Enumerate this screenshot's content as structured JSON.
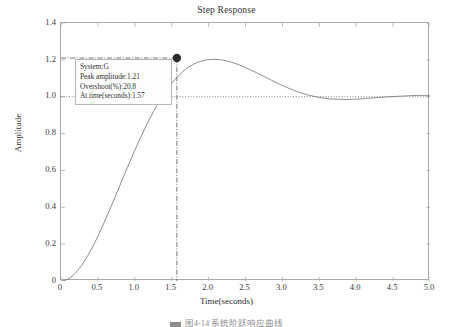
{
  "chart_data": {
    "type": "line",
    "title": "Step Response",
    "xlabel": "Time(seconds)",
    "ylabel": "Amplitude",
    "xlim": [
      0,
      5.0
    ],
    "ylim": [
      0,
      1.4
    ],
    "grid": false,
    "legend": "none",
    "xticks": [
      "0",
      "0.5",
      "1.0",
      "1.5",
      "2.0",
      "2.5",
      "3.0",
      "3.5",
      "4.0",
      "4.5",
      "5.0"
    ],
    "xtick_values": [
      0,
      0.5,
      1.0,
      1.5,
      2.0,
      2.5,
      3.0,
      3.5,
      4.0,
      4.5,
      5.0
    ],
    "yticks": [
      "0",
      "0.2",
      "0.4",
      "0.6",
      "0.8",
      "1.0",
      "1.2",
      "1.4"
    ],
    "ytick_values": [
      0,
      0.2,
      0.4,
      0.6,
      0.8,
      1.0,
      1.2,
      1.4
    ],
    "series": [
      {
        "name": "G",
        "color": "#808080",
        "x": [
          0,
          0.05,
          0.1,
          0.15,
          0.2,
          0.25,
          0.3,
          0.35,
          0.4,
          0.45,
          0.5,
          0.55,
          0.6,
          0.65,
          0.7,
          0.75,
          0.8,
          0.85,
          0.9,
          0.95,
          1.0,
          1.05,
          1.1,
          1.15,
          1.2,
          1.25,
          1.3,
          1.35,
          1.4,
          1.45,
          1.5,
          1.57,
          1.65,
          1.75,
          1.85,
          1.95,
          2.05,
          2.15,
          2.25,
          2.35,
          2.45,
          2.55,
          2.65,
          2.75,
          2.85,
          2.95,
          3.05,
          3.15,
          3.25,
          3.35,
          3.45,
          3.55,
          3.65,
          3.75,
          3.85,
          3.95,
          4.05,
          4.15,
          4.25,
          4.35,
          4.45,
          4.55,
          4.65,
          4.75,
          4.85,
          4.95,
          5.0
        ],
        "y": [
          0,
          0.003,
          0.012,
          0.026,
          0.045,
          0.069,
          0.097,
          0.129,
          0.164,
          0.202,
          0.243,
          0.286,
          0.331,
          0.377,
          0.424,
          0.472,
          0.52,
          0.568,
          0.616,
          0.663,
          0.709,
          0.754,
          0.797,
          0.839,
          0.879,
          0.917,
          0.953,
          0.987,
          1.018,
          1.047,
          1.073,
          1.105,
          1.137,
          1.166,
          1.186,
          1.198,
          1.203,
          1.201,
          1.194,
          1.182,
          1.167,
          1.149,
          1.13,
          1.11,
          1.09,
          1.07,
          1.052,
          1.035,
          1.021,
          1.009,
          1.0,
          0.993,
          0.988,
          0.986,
          0.985,
          0.986,
          0.988,
          0.991,
          0.994,
          0.997,
          1.0,
          1.002,
          1.004,
          1.006,
          1.007,
          1.007,
          1.007
        ]
      }
    ],
    "reference_lines": [
      {
        "name": "steady-state",
        "orientation": "horizontal",
        "value": 1.0,
        "style": "dotted"
      },
      {
        "name": "peak-level",
        "orientation": "horizontal",
        "value": 1.21,
        "style": "dash-dot"
      },
      {
        "name": "peak-time",
        "orientation": "vertical",
        "value": 1.57,
        "style": "dash-dot"
      }
    ],
    "markers": [
      {
        "name": "peak-marker",
        "x": 1.57,
        "y": 1.21,
        "color": "#2b2b2b"
      }
    ],
    "annotations": {
      "datatip": {
        "system": "System:G",
        "peak_amplitude": "Peak amplitude:1.21",
        "overshoot": "Overshoot(%):20.8",
        "at_time": "At time(seconds):1.57"
      }
    }
  },
  "caption": {
    "text": "图4-14  系统阶跃响应曲线"
  }
}
